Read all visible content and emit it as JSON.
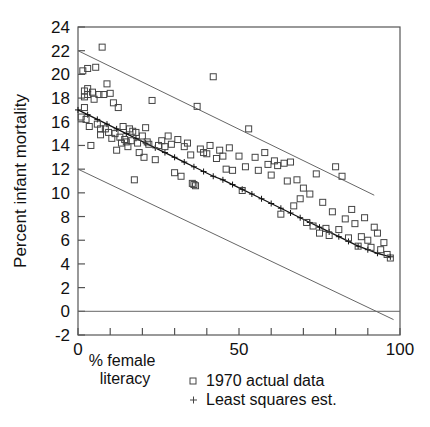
{
  "chart_data": {
    "type": "scatter",
    "title": "",
    "xlabel": "% female literacy",
    "ylabel": "Percent infant mortality",
    "xlim": [
      0,
      100
    ],
    "ylim": [
      -2,
      24
    ],
    "grid": false,
    "x_ticks": [
      0,
      10,
      20,
      30,
      40,
      50,
      60,
      70,
      80,
      90,
      100
    ],
    "x_tick_labels": [
      "0",
      "",
      "",
      "",
      "",
      "50",
      "",
      "",
      "",
      "",
      "100"
    ],
    "y_ticks": [
      -2,
      0,
      2,
      4,
      6,
      8,
      10,
      12,
      14,
      16,
      18,
      20,
      22,
      24
    ],
    "y_tick_labels": [
      "-2",
      "0",
      "2",
      "4",
      "6",
      "8",
      "10",
      "12",
      "14",
      "16",
      "18",
      "20",
      "22",
      "24"
    ],
    "legend_position": "below-right",
    "series": [
      {
        "name": "1970 actual data",
        "marker": "open-square",
        "type": "scatter",
        "points": [
          [
            1,
            16.4
          ],
          [
            1.5,
            20.3
          ],
          [
            2,
            18.6
          ],
          [
            2,
            18.1
          ],
          [
            2,
            17.2
          ],
          [
            2.5,
            16.2
          ],
          [
            3,
            20.5
          ],
          [
            3,
            18.8
          ],
          [
            3,
            18.3
          ],
          [
            3.5,
            15.6
          ],
          [
            4,
            14.0
          ],
          [
            4.5,
            18.5
          ],
          [
            5,
            17.9
          ],
          [
            5.5,
            20.6
          ],
          [
            6,
            15.8
          ],
          [
            6.5,
            18.3
          ],
          [
            7,
            15.4
          ],
          [
            7,
            14.9
          ],
          [
            7.5,
            22.3
          ],
          [
            8,
            18.3
          ],
          [
            8.5,
            15.4
          ],
          [
            9,
            19.2
          ],
          [
            9.5,
            15.1
          ],
          [
            10,
            18.4
          ],
          [
            10.5,
            14.6
          ],
          [
            11,
            17.6
          ],
          [
            11.5,
            15.0
          ],
          [
            12,
            13.6
          ],
          [
            12.5,
            17.2
          ],
          [
            13,
            14.7
          ],
          [
            13.5,
            14.2
          ],
          [
            14,
            15.6
          ],
          [
            14.5,
            14.5
          ],
          [
            15,
            14.3
          ],
          [
            15.5,
            13.9
          ],
          [
            16,
            15.4
          ],
          [
            16.5,
            14.4
          ],
          [
            17,
            15.2
          ],
          [
            17.5,
            11.1
          ],
          [
            18,
            15.1
          ],
          [
            18.5,
            14.2
          ],
          [
            19,
            13.4
          ],
          [
            20,
            14.8
          ],
          [
            20.5,
            13.0
          ],
          [
            21,
            15.5
          ],
          [
            21.5,
            14.3
          ],
          [
            22,
            14.1
          ],
          [
            23,
            17.8
          ],
          [
            24,
            12.8
          ],
          [
            25,
            14.0
          ],
          [
            26,
            14.4
          ],
          [
            27,
            13.9
          ],
          [
            28,
            14.8
          ],
          [
            29,
            14.1
          ],
          [
            30,
            11.7
          ],
          [
            31,
            14.5
          ],
          [
            32,
            11.4
          ],
          [
            33,
            13.9
          ],
          [
            34,
            14.2
          ],
          [
            35,
            13.2
          ],
          [
            35.5,
            10.8
          ],
          [
            36,
            10.7
          ],
          [
            36.5,
            10.6
          ],
          [
            37,
            17.3
          ],
          [
            38,
            13.7
          ],
          [
            39,
            13.4
          ],
          [
            40,
            13.3
          ],
          [
            41,
            14.0
          ],
          [
            42,
            19.8
          ],
          [
            43,
            12.9
          ],
          [
            44,
            13.6
          ],
          [
            45,
            13.1
          ],
          [
            46,
            12.0
          ],
          [
            47,
            13.8
          ],
          [
            48,
            11.9
          ],
          [
            50,
            13.1
          ],
          [
            51,
            10.2
          ],
          [
            52,
            12.2
          ],
          [
            53,
            15.4
          ],
          [
            55,
            13.0
          ],
          [
            56,
            11.9
          ],
          [
            58,
            13.4
          ],
          [
            59,
            12.4
          ],
          [
            60,
            11.5
          ],
          [
            61,
            12.7
          ],
          [
            62,
            12.3
          ],
          [
            63,
            8.2
          ],
          [
            64,
            12.5
          ],
          [
            65,
            11.0
          ],
          [
            66,
            12.6
          ],
          [
            67,
            8.9
          ],
          [
            68,
            11.1
          ],
          [
            69,
            9.5
          ],
          [
            70,
            10.4
          ],
          [
            71,
            7.5
          ],
          [
            72,
            9.9
          ],
          [
            73,
            7.2
          ],
          [
            74,
            11.6
          ],
          [
            75,
            6.6
          ],
          [
            76,
            9.2
          ],
          [
            77,
            7.0
          ],
          [
            78,
            6.4
          ],
          [
            79,
            8.4
          ],
          [
            80,
            12.2
          ],
          [
            81,
            6.9
          ],
          [
            82,
            11.4
          ],
          [
            83,
            7.8
          ],
          [
            84,
            6.2
          ],
          [
            85,
            8.6
          ],
          [
            86,
            7.4
          ],
          [
            87,
            5.5
          ],
          [
            88,
            6.3
          ],
          [
            89,
            7.9
          ],
          [
            90,
            6.0
          ],
          [
            91,
            5.4
          ],
          [
            92,
            7.1
          ],
          [
            93,
            6.6
          ],
          [
            94,
            5.2
          ],
          [
            95,
            5.8
          ],
          [
            96,
            4.8
          ],
          [
            97,
            4.5
          ]
        ]
      },
      {
        "name": "Least squares est.",
        "marker": "plus",
        "type": "line",
        "points": [
          [
            0,
            17.0
          ],
          [
            3,
            16.6
          ],
          [
            6,
            16.2
          ],
          [
            9,
            15.8
          ],
          [
            12,
            15.4
          ],
          [
            15,
            15.0
          ],
          [
            18,
            14.6
          ],
          [
            21,
            14.2
          ],
          [
            24,
            13.8
          ],
          [
            27,
            13.4
          ],
          [
            30,
            13.0
          ],
          [
            33,
            12.6
          ],
          [
            36,
            12.2
          ],
          [
            39,
            11.8
          ],
          [
            42,
            11.4
          ],
          [
            45,
            11.1
          ],
          [
            48,
            10.7
          ],
          [
            51,
            10.3
          ],
          [
            54,
            9.9
          ],
          [
            57,
            9.5
          ],
          [
            60,
            9.1
          ],
          [
            63,
            8.7
          ],
          [
            66,
            8.3
          ],
          [
            69,
            7.9
          ],
          [
            72,
            7.5
          ],
          [
            75,
            7.1
          ],
          [
            78,
            6.7
          ],
          [
            81,
            6.3
          ],
          [
            84,
            5.9
          ],
          [
            87,
            5.5
          ],
          [
            90,
            5.2
          ],
          [
            93,
            4.9
          ],
          [
            97,
            4.6
          ]
        ]
      }
    ],
    "annotation_lines": [
      {
        "name": "upper-confidence-band",
        "points": [
          [
            0,
            22.0
          ],
          [
            92,
            9.8
          ]
        ]
      },
      {
        "name": "lower-confidence-band",
        "points": [
          [
            0,
            12.0
          ],
          [
            98,
            -0.7
          ]
        ]
      },
      {
        "name": "zero-reference-line",
        "points": [
          [
            0,
            0
          ],
          [
            100,
            0
          ]
        ]
      }
    ]
  },
  "legend": {
    "entries": [
      {
        "marker": "open-square",
        "label": "1970 actual data"
      },
      {
        "marker": "plus",
        "label": "Least squares est."
      }
    ]
  },
  "axes": {
    "y_title": "Percent infant mortality",
    "x_title_line1": "% female",
    "x_title_line2": "literacy"
  }
}
